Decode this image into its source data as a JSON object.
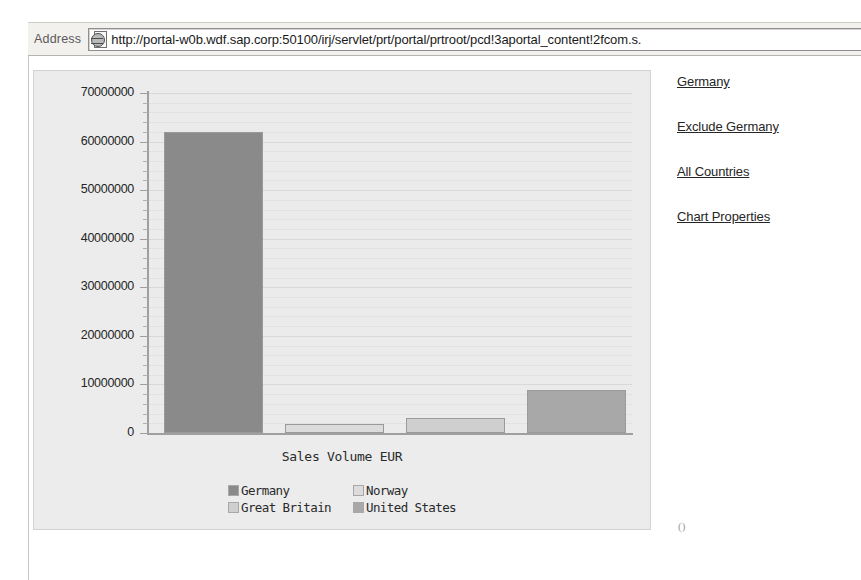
{
  "browser": {
    "address_label": "Address",
    "url": "http://portal-w0b.wdf.sap.corp:50100/irj/servlet/prt/portal/prtroot/pcd!3aportal_content!2fcom.s.",
    "page_icon": "page-globe-icon"
  },
  "links": [
    {
      "label": "Germany"
    },
    {
      "label": "Exclude Germany"
    },
    {
      "label": "All Countries"
    },
    {
      "label": "Chart Properties"
    }
  ],
  "stray_mark": "()",
  "chart_data": {
    "type": "bar",
    "title": "",
    "xlabel": "Sales Volume EUR",
    "ylabel": "",
    "categories": [
      "Germany",
      "Norway",
      "Great Britain",
      "United States"
    ],
    "values": [
      62000000,
      1800000,
      3000000,
      8800000
    ],
    "series": [
      {
        "name": "Sales Volume EUR",
        "values": [
          62000000,
          1800000,
          3000000,
          8800000
        ]
      }
    ],
    "colors": [
      "#8a8a8a",
      "#dcdcdc",
      "#cfcfcf",
      "#a8a8a8"
    ],
    "ylim": [
      0,
      70000000
    ],
    "ytick_values": [
      70000000,
      60000000,
      50000000,
      40000000,
      30000000,
      20000000,
      10000000,
      0
    ],
    "ytick_labels": [
      "70000000",
      "60000000",
      "50000000",
      "40000000",
      "30000000",
      "20000000",
      "10000000",
      "0"
    ],
    "minor_ticks_per_interval": 5,
    "grid": true,
    "grid_axis": "y",
    "legend_position": "bottom",
    "legend": [
      {
        "label": "Germany",
        "color": "#8a8a8a"
      },
      {
        "label": "Norway",
        "color": "#dcdcdc"
      },
      {
        "label": "Great Britain",
        "color": "#cfcfcf"
      },
      {
        "label": "United States",
        "color": "#a8a8a8"
      }
    ],
    "plot_background": "#ebebeb",
    "image_background": "#ececec"
  }
}
